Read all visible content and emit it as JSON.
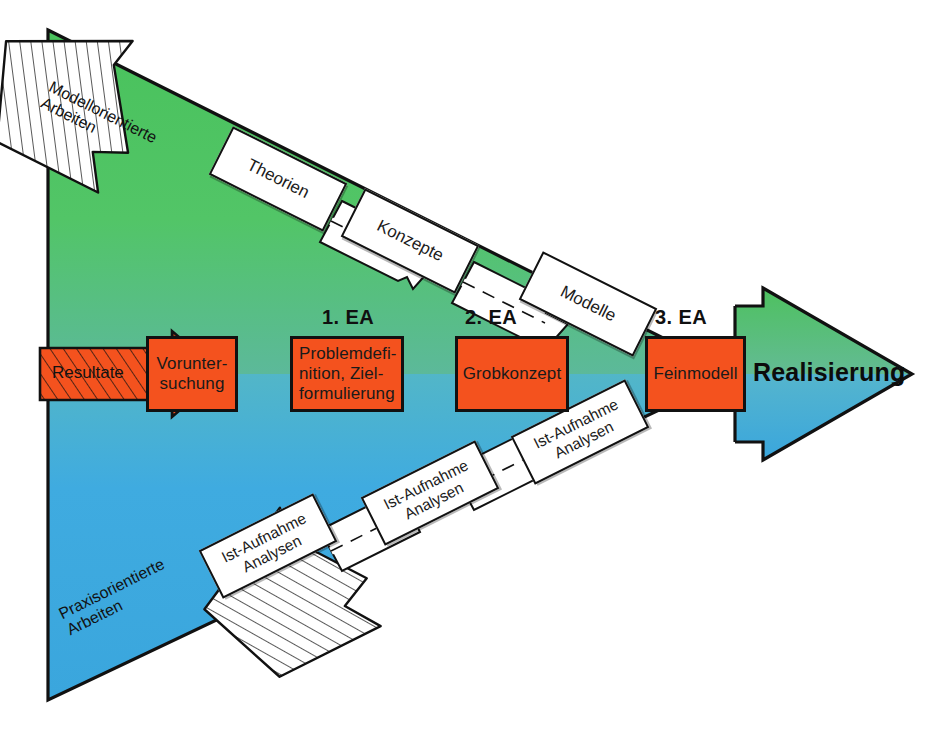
{
  "diagram": {
    "colors": {
      "green": "#4dc45f",
      "blue": "#3aa6dd",
      "orange": "#f4521e",
      "outline": "#111111",
      "white": "#ffffff"
    },
    "final_label": "Realisierung",
    "stage_labels": [
      {
        "id": "ea1",
        "text": "1. EA"
      },
      {
        "id": "ea2",
        "text": "2. EA"
      },
      {
        "id": "ea3",
        "text": "3. EA"
      }
    ],
    "process_boxes": [
      {
        "id": "voruntersuchung",
        "lines": [
          "Vorunter-",
          "suchung"
        ]
      },
      {
        "id": "problemdefinition",
        "lines": [
          "Problemdefi-",
          "nition, Ziel-",
          "formulierung"
        ]
      },
      {
        "id": "grobkonzept",
        "lines": [
          "Grobkonzept"
        ]
      },
      {
        "id": "feinmodell",
        "lines": [
          "Feinmodell"
        ]
      }
    ],
    "top_chain": [
      {
        "id": "theorien",
        "lines": [
          "Theorien"
        ]
      },
      {
        "id": "konzepte",
        "lines": [
          "Konzepte"
        ]
      },
      {
        "id": "modelle",
        "lines": [
          "Modelle"
        ]
      }
    ],
    "bottom_chain": [
      {
        "id": "ist-aufnahme-1",
        "lines": [
          "Ist-Aufnahme",
          "Analysen"
        ]
      },
      {
        "id": "ist-aufnahme-2",
        "lines": [
          "Ist-Aufnahme",
          "Analysen"
        ]
      },
      {
        "id": "ist-aufnahme-3",
        "lines": [
          "Ist-Aufnahme",
          "Analysen"
        ]
      }
    ],
    "entry_arrows": [
      {
        "id": "modellorientierte-arbeiten",
        "lines": [
          "Modellorientierte",
          "Arbeiten"
        ],
        "style": "hatched-white"
      },
      {
        "id": "resultate",
        "lines": [
          "Resultate"
        ],
        "style": "hatched-orange"
      },
      {
        "id": "praxisorientierte-arbeiten",
        "lines": [
          "Praxisorientierte",
          "Arbeiten"
        ],
        "style": "hatched-white"
      }
    ]
  }
}
